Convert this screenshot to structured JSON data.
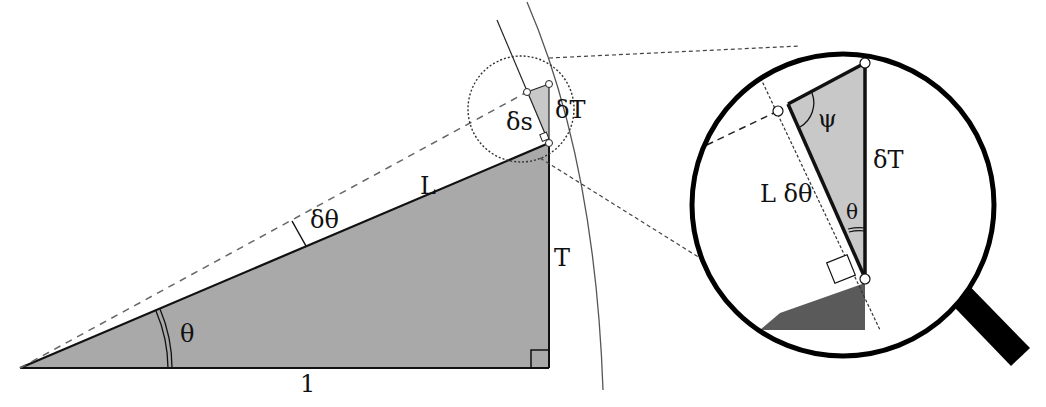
{
  "diagram": {
    "type": "geometry",
    "colors": {
      "fill_main": "#a9a9a9",
      "fill_small": "#c8c8c8",
      "fill_dark": "#5a5a5a",
      "stroke": "#111111",
      "dash": "#555555"
    },
    "labels": {
      "base": "1",
      "height": "T",
      "hypotenuse": "L",
      "angle": "θ",
      "delta_angle": "δθ",
      "delta_s": "δs",
      "delta_T": "δT",
      "zoom_delta_T": "δT",
      "zoom_L_delta_theta": "L δθ",
      "zoom_theta": "θ",
      "zoom_psi": "ψ"
    }
  }
}
